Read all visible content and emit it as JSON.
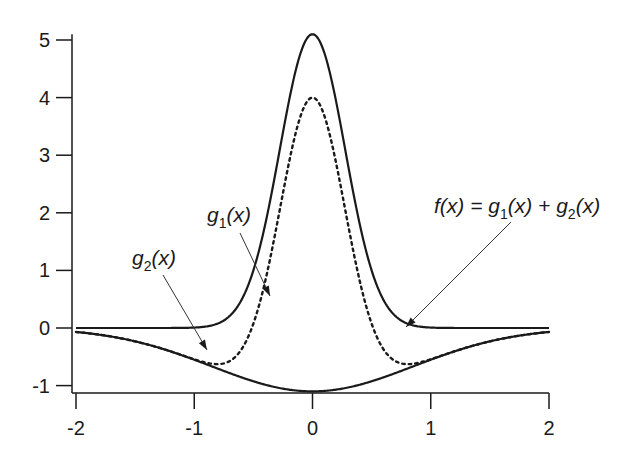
{
  "chart_data": {
    "type": "line",
    "title": "",
    "xlabel": "",
    "ylabel": "",
    "xlim": [
      -2,
      2
    ],
    "ylim": [
      -1.15,
      5.1
    ],
    "grid": false,
    "legend": "none (inline arrow annotations)",
    "x_ticks": [
      -2,
      -1,
      0,
      1,
      2
    ],
    "x_tick_labels": [
      "-2",
      "-1",
      "0",
      "1",
      "2"
    ],
    "y_ticks": [
      -1,
      0,
      1,
      2,
      3,
      4,
      5
    ],
    "y_tick_labels": [
      "-1",
      "0",
      "1",
      "2",
      "3",
      "4",
      "5"
    ],
    "x": [
      -2.0,
      -1.75,
      -1.5,
      -1.25,
      -1.0,
      -0.75,
      -0.5,
      -0.4,
      -0.3,
      -0.2,
      -0.1,
      0.0,
      0.1,
      0.2,
      0.3,
      0.4,
      0.5,
      0.75,
      1.0,
      1.25,
      1.5,
      1.75,
      2.0
    ],
    "series": [
      {
        "name": "g1(x)",
        "style": "solid",
        "description": "narrow Gaussian peak, amplitude ~5.1, sigma ~0.28",
        "values": [
          0.0,
          0.0,
          0.0,
          0.0,
          0.0,
          0.03,
          0.99,
          1.77,
          2.87,
          3.99,
          4.78,
          5.1,
          4.78,
          3.99,
          2.87,
          1.77,
          0.99,
          0.03,
          0.0,
          0.0,
          0.0,
          0.0,
          0.0
        ]
      },
      {
        "name": "g2(x)",
        "style": "solid",
        "description": "wide negative Gaussian, depth ~-1.1, sigma ~0.85",
        "values": [
          -0.07,
          -0.13,
          -0.23,
          -0.37,
          -0.55,
          -0.74,
          -0.92,
          -0.98,
          -1.03,
          -1.07,
          -1.09,
          -1.1,
          -1.09,
          -1.07,
          -1.03,
          -0.98,
          -0.92,
          -0.74,
          -0.55,
          -0.37,
          -0.23,
          -0.13,
          -0.07
        ]
      },
      {
        "name": "f(x) = g1(x) + g2(x)",
        "style": "dotted",
        "description": "sum of g1 and g2, peak ~4.0",
        "values": [
          -0.07,
          -0.13,
          -0.23,
          -0.37,
          -0.55,
          -0.71,
          0.07,
          0.79,
          1.84,
          2.92,
          3.69,
          4.0,
          3.69,
          2.92,
          1.84,
          0.79,
          0.07,
          -0.71,
          -0.55,
          -0.37,
          -0.23,
          -0.13,
          -0.07
        ]
      }
    ],
    "annotations": [
      {
        "text": "g1(x)",
        "points_to": "g1(x) solid curve near x=-0.55, y=0.7"
      },
      {
        "text": "g2(x)",
        "points_to": "g2(x) solid curve near x=-1.1, y=-0.45"
      },
      {
        "text": "f(x) = g1(x) + g2(x)",
        "points_to": "dotted curve near x=0.65, y=-0.45"
      }
    ]
  },
  "labels": {
    "g1": {
      "base": "g",
      "sub": "1",
      "arg": "(x)"
    },
    "g2": {
      "base": "g",
      "sub": "2",
      "arg": "(x)"
    },
    "f": {
      "lhs": "f(x) = ",
      "g1base": "g",
      "g1sub": "1",
      "g1arg": "(x) + ",
      "g2base": "g",
      "g2sub": "2",
      "g2arg": "(x)"
    }
  }
}
